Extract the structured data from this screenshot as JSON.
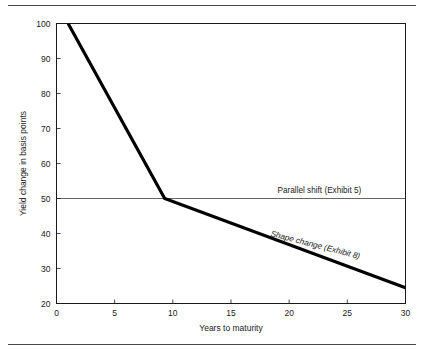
{
  "figure": {
    "background_color": "#ffffff",
    "rule_color": "#4a4a4a",
    "has_top_rule": true,
    "has_bottom_rule": true
  },
  "chart_data": {
    "type": "line",
    "title": "",
    "subtitle": "",
    "xlabel": "Years to maturity",
    "ylabel": "Yield change in basis points",
    "xlim": [
      0,
      30
    ],
    "ylim": [
      20,
      100
    ],
    "xticks": [
      0,
      5,
      10,
      15,
      20,
      25,
      30
    ],
    "xtick_labels": [
      "0",
      "5",
      "10",
      "15",
      "20",
      "25",
      "30"
    ],
    "yticks": [
      20,
      30,
      40,
      50,
      60,
      70,
      80,
      90,
      100
    ],
    "ytick_labels": [
      "20",
      "30",
      "40",
      "50",
      "60",
      "70",
      "80",
      "90",
      "100"
    ],
    "grid": false,
    "legend_position": "inline-annotations",
    "series": [
      {
        "name": "Shape change (Exhibit 8)",
        "style": "thick-solid",
        "color": "#000000",
        "line_width": 3.2,
        "x": [
          1,
          9.3,
          30
        ],
        "y": [
          100,
          50,
          24.5
        ]
      },
      {
        "name": "Parallel shift (Exhibit 5)",
        "style": "thin-solid",
        "color": "#555555",
        "line_width": 0.9,
        "x": [
          0,
          30
        ],
        "y": [
          50,
          50
        ]
      }
    ],
    "annotations": [
      {
        "text": "Parallel shift (Exhibit 5)",
        "x": 22.6,
        "y": 51.6,
        "rotation": 0,
        "italic": false,
        "anchor": "middle"
      },
      {
        "text": "Shape change (Exhibit 8)",
        "x": 22.2,
        "y": 36.0,
        "rotation": 14.5,
        "italic": true,
        "anchor": "middle"
      }
    ]
  }
}
